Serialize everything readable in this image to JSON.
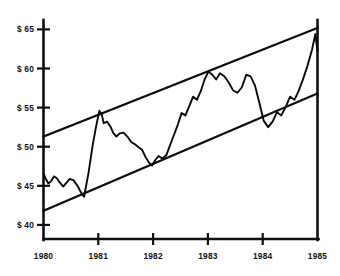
{
  "chart_data": {
    "type": "line",
    "title": "",
    "subtitle": "",
    "xlabel": "",
    "ylabel": "",
    "grid": false,
    "legend": "none",
    "xlim": [
      1980,
      1985
    ],
    "ylim": [
      38.2,
      66.2
    ],
    "y_ticks": [
      40,
      45,
      50,
      55,
      60,
      65
    ],
    "y_tick_labels": [
      "$ 40",
      "$ 45",
      "$ 50",
      "$ 55",
      "$ 60",
      "$ 65"
    ],
    "x_ticks": [
      1980,
      1981,
      1982,
      1983,
      1984,
      1985
    ],
    "x_tick_labels": [
      "1980",
      "1981",
      "1982",
      "1983",
      "1984",
      "1985"
    ],
    "series": [
      {
        "name": "price",
        "x": [
          1980.0,
          1980.04,
          1980.09,
          1980.14,
          1980.19,
          1980.24,
          1980.3,
          1980.36,
          1980.42,
          1980.48,
          1980.55,
          1980.62,
          1980.68,
          1980.74,
          1980.82,
          1980.9,
          1980.96,
          1981.02,
          1981.06,
          1981.1,
          1981.16,
          1981.22,
          1981.27,
          1981.33,
          1981.39,
          1981.46,
          1981.53,
          1981.6,
          1981.67,
          1981.74,
          1981.8,
          1981.86,
          1981.92,
          1981.98,
          1982.04,
          1982.1,
          1982.17,
          1982.24,
          1982.31,
          1982.38,
          1982.45,
          1982.52,
          1982.59,
          1982.66,
          1982.73,
          1982.8,
          1982.87,
          1982.94,
          1983.01,
          1983.08,
          1983.15,
          1983.22,
          1983.3,
          1983.38,
          1983.46,
          1983.54,
          1983.62,
          1983.7,
          1983.78,
          1983.86,
          1983.94,
          1984.02,
          1984.1,
          1984.18,
          1984.26,
          1984.34,
          1984.42,
          1984.5,
          1984.58,
          1984.66,
          1984.74,
          1984.82,
          1984.9,
          1984.96,
          1985.0
        ],
        "y": [
          46.6,
          45.9,
          45.3,
          45.6,
          46.2,
          46.0,
          45.4,
          44.9,
          45.4,
          45.9,
          45.7,
          45.0,
          44.2,
          43.6,
          46.6,
          50.3,
          52.6,
          54.6,
          54.2,
          53.0,
          53.2,
          52.6,
          51.8,
          51.3,
          51.7,
          51.8,
          51.3,
          50.6,
          50.3,
          49.9,
          49.6,
          48.7,
          48.0,
          47.6,
          48.3,
          48.8,
          48.5,
          48.9,
          50.2,
          51.5,
          52.8,
          54.3,
          54.0,
          55.2,
          56.4,
          56.0,
          57.1,
          58.6,
          59.6,
          59.2,
          58.6,
          59.4,
          59.0,
          58.2,
          57.2,
          56.9,
          57.6,
          59.2,
          59.0,
          57.8,
          55.6,
          53.3,
          52.5,
          53.2,
          54.4,
          54.0,
          55.1,
          56.4,
          56.0,
          57.2,
          58.7,
          60.4,
          62.4,
          64.4,
          62.2
        ]
      },
      {
        "name": "upper-trendline",
        "x": [
          1980,
          1985
        ],
        "y": [
          51.3,
          65.2
        ]
      },
      {
        "name": "lower-trendline",
        "x": [
          1980,
          1985
        ],
        "y": [
          41.8,
          56.8
        ]
      }
    ],
    "annotations": []
  }
}
